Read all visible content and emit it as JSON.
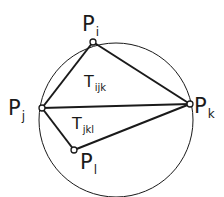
{
  "diagram": {
    "type": "delaunay-circumcircle",
    "points": [
      {
        "id": "Pi",
        "base": "P",
        "sub": "i",
        "x": 93,
        "y": 42
      },
      {
        "id": "Pj",
        "base": "P",
        "sub": "j",
        "x": 42,
        "y": 108
      },
      {
        "id": "Pk",
        "base": "P",
        "sub": "k",
        "x": 190,
        "y": 104
      },
      {
        "id": "Pl",
        "base": "P",
        "sub": "l",
        "x": 74,
        "y": 150
      }
    ],
    "triangles": [
      {
        "id": "Tijk",
        "base": "T",
        "sub": "ijk"
      },
      {
        "id": "Tjkl",
        "base": "T",
        "sub": "jkl"
      }
    ],
    "circle": {
      "cx": 116,
      "cy": 120,
      "r": 77
    },
    "colors": {
      "stroke": "#1a1a1a",
      "background": "#ffffff"
    }
  }
}
